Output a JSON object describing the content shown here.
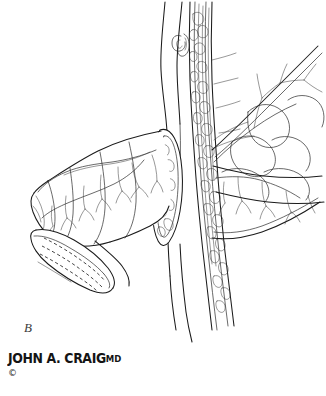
{
  "figure": {
    "panel_label": "B",
    "background_color": "#ffffff",
    "ink_color": "#1b1b1b",
    "width": 326,
    "height": 396,
    "medium": "pen-and-ink line drawing"
  },
  "credit": {
    "artist_name": "JOHN A. CRAIG",
    "artist_suffix": "MD",
    "copyright_mark": "©"
  },
  "structures": {
    "left_organ": {
      "name": "mobilized bowel segment",
      "features": [
        "segmental divisions",
        "serosal vessel arcade",
        "cut end with dashed suture line"
      ]
    },
    "central_tube_smooth": {
      "name": "vessel with smooth wall",
      "features": [
        "parallel wall outlines",
        "vertical course"
      ]
    },
    "central_tube_textured": {
      "name": "mesenteric pedicle",
      "features": [
        "cobblestone fat lobules",
        "longitudinal vessel strands"
      ]
    },
    "spiral_marker": {
      "name": "coiled valve structure"
    },
    "anastomosis_stoma": {
      "name": "oval cut stoma at junction"
    },
    "right_organ": {
      "name": "lobed organ segment",
      "features": [
        "scalloped lobules",
        "branching vessels toward upper right"
      ]
    }
  }
}
